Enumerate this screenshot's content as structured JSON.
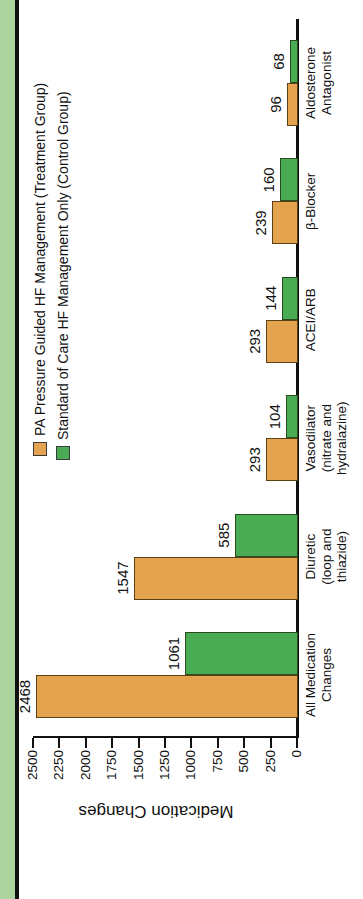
{
  "palette": {
    "treatment_fill": "#E4A44F",
    "treatment_border": "#5c4114",
    "control_fill": "#49AB54",
    "control_border": "#2b4a1e",
    "page_strip": "#ABD49E",
    "page_rule": "#111111",
    "axis": "#111111"
  },
  "chart_data": {
    "type": "bar",
    "ylabel": "Medication Changes",
    "ylim": [
      0,
      2500
    ],
    "yticks": [
      0,
      250,
      500,
      750,
      1000,
      1250,
      1500,
      1750,
      2000,
      2250,
      2500
    ],
    "grid": false,
    "legend_position": "top-right",
    "orientation": "figure rotated 90deg CCW on portrait page",
    "categories": [
      "All Medication Changes",
      "Diuretic (loop and thiazide)",
      "Vasodilator (nitrate and hydralazine)",
      "ACEI/ARB",
      "β-Blocker",
      "Aldosterone Antagonist"
    ],
    "category_lines": [
      [
        "All Medication",
        "Changes"
      ],
      [
        "Diuretic",
        "(loop and",
        "thiazide)"
      ],
      [
        "Vasodilator",
        "(nitrate and",
        "hydralazine)"
      ],
      [
        "ACEI/ARB"
      ],
      [
        "β-Blocker"
      ],
      [
        "Aldosterone",
        "Antagonist"
      ]
    ],
    "series": [
      {
        "name": "PA Pressure Guided HF Management (Treatment Group)",
        "role": "treatment",
        "values": [
          2468,
          1547,
          293,
          293,
          239,
          96
        ]
      },
      {
        "name": "Standard of Care HF Management Only (Control Group)",
        "role": "control",
        "values": [
          1061,
          585,
          104,
          144,
          160,
          68
        ]
      }
    ]
  }
}
